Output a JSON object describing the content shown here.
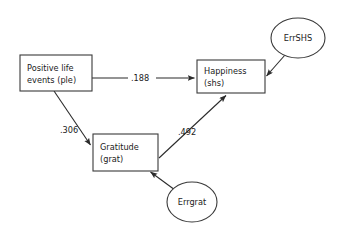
{
  "diagram": {
    "type": "path-diagram",
    "background_color": "#ffffff",
    "stroke_color": "#2b2b2b",
    "text_color": "#1b1b1b",
    "nodes": [
      {
        "id": "ple",
        "shape": "rectangle",
        "role": "observed-variable",
        "line1": "Positive life",
        "line2": "events (ple)",
        "x": 20,
        "y": 55,
        "w": 72,
        "h": 36
      },
      {
        "id": "grat",
        "shape": "rectangle",
        "role": "observed-variable",
        "line1": "Gratitude",
        "line2": "(grat)",
        "x": 93,
        "y": 134,
        "w": 65,
        "h": 37
      },
      {
        "id": "shs",
        "shape": "rectangle",
        "role": "observed-variable",
        "line1": "Happiness",
        "line2": "(shs)",
        "x": 197,
        "y": 60,
        "w": 68,
        "h": 33
      },
      {
        "id": "errshs",
        "shape": "ellipse",
        "role": "error-term",
        "label": "ErrSHS",
        "cx": 298,
        "cy": 38,
        "rx": 27,
        "ry": 20
      },
      {
        "id": "errgrat",
        "shape": "ellipse",
        "role": "error-term",
        "label": "Errgrat",
        "cx": 192,
        "cy": 202,
        "rx": 25,
        "ry": 20
      }
    ],
    "edges": [
      {
        "id": "ple-to-shs",
        "from": "ple",
        "to": "shs",
        "coefficient": ".188",
        "label_x": 131,
        "label_y": 81
      },
      {
        "id": "ple-to-grat",
        "from": "ple",
        "to": "grat",
        "coefficient": ".306",
        "label_x": 60,
        "label_y": 133
      },
      {
        "id": "grat-to-shs",
        "from": "grat",
        "to": "shs",
        "coefficient": ".492",
        "label_x": 178,
        "label_y": 135
      },
      {
        "id": "errshs-to-shs",
        "from": "errshs",
        "to": "shs",
        "coefficient": ""
      },
      {
        "id": "errgrat-to-grat",
        "from": "errgrat",
        "to": "grat",
        "coefficient": ""
      }
    ]
  }
}
